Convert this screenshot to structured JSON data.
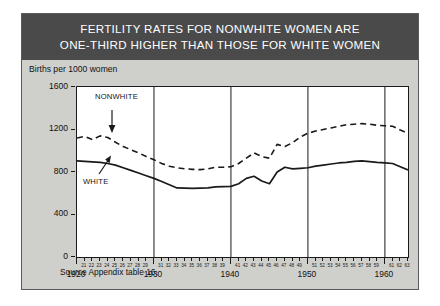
{
  "figure": {
    "title_lines": [
      "FERTILITY RATES FOR NONWHITE WOMEN ARE",
      "ONE-THIRD HIGHER THAN THOSE FOR WHITE WOMEN"
    ],
    "axis_caption": "Births per 1000 women",
    "source_note": "Source Appendix table 16.",
    "colors": {
      "title_band": "#4a4a4a",
      "title_text": "#ffffff",
      "figure_background": "#cfcfcb",
      "plot_background": "#ffffff",
      "line": "#1a1a1a"
    }
  },
  "chart_data": {
    "type": "line",
    "title": "FERTILITY RATES FOR NONWHITE WOMEN ARE ONE-THIRD HIGHER THAN THOSE FOR WHITE WOMEN",
    "xlabel": "",
    "ylabel": "Births per 1000 women",
    "ylim": [
      0,
      1600
    ],
    "yticks": [
      0,
      400,
      800,
      1200,
      1600
    ],
    "xlim": [
      1920,
      1963
    ],
    "grid": false,
    "gridlines_x": [
      1930,
      1940,
      1950,
      1960
    ],
    "decade_labels": [
      "1920",
      "1930",
      "1940",
      "1950",
      "1960"
    ],
    "xtick_labels": [
      "21",
      "22",
      "23",
      "24",
      "25",
      "26",
      "27",
      "28",
      "29",
      "31",
      "32",
      "33",
      "34",
      "35",
      "36",
      "37",
      "38",
      "39",
      "41",
      "42",
      "43",
      "44",
      "45",
      "46",
      "47",
      "48",
      "49",
      "51",
      "52",
      "53",
      "54",
      "55",
      "56",
      "57",
      "58",
      "59",
      "61",
      "62",
      "63"
    ],
    "legend_position": "inline-annotations",
    "x": [
      1920,
      1921,
      1922,
      1923,
      1924,
      1925,
      1926,
      1927,
      1928,
      1929,
      1930,
      1931,
      1932,
      1933,
      1934,
      1935,
      1936,
      1937,
      1938,
      1939,
      1940,
      1941,
      1942,
      1943,
      1944,
      1945,
      1946,
      1947,
      1948,
      1949,
      1950,
      1951,
      1952,
      1953,
      1954,
      1955,
      1956,
      1957,
      1958,
      1959,
      1960,
      1961,
      1962,
      1963
    ],
    "series": [
      {
        "name": "NONWHITE",
        "style": "dashed",
        "values": [
          1120,
          1135,
          1105,
          1140,
          1125,
          1080,
          1040,
          1010,
          980,
          945,
          915,
          880,
          855,
          840,
          830,
          825,
          822,
          830,
          845,
          845,
          850,
          880,
          930,
          980,
          945,
          930,
          1060,
          1040,
          1075,
          1130,
          1165,
          1185,
          1200,
          1215,
          1230,
          1245,
          1250,
          1255,
          1250,
          1240,
          1235,
          1230,
          1195,
          1165
        ]
      },
      {
        "name": "WHITE",
        "style": "solid",
        "values": [
          905,
          900,
          895,
          890,
          880,
          865,
          840,
          815,
          790,
          765,
          740,
          710,
          680,
          650,
          648,
          645,
          648,
          650,
          660,
          662,
          665,
          690,
          740,
          760,
          715,
          690,
          800,
          845,
          830,
          835,
          840,
          855,
          865,
          875,
          885,
          890,
          900,
          905,
          898,
          890,
          885,
          880,
          850,
          820
        ]
      }
    ],
    "annotations": [
      {
        "text": "NONWHITE",
        "points_to_year": 1927,
        "arrow": "down"
      },
      {
        "text": "WHITE",
        "points_to_year": 1925,
        "arrow": "up"
      }
    ]
  }
}
